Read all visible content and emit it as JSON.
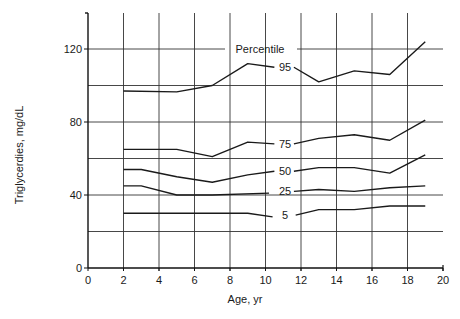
{
  "chart_data": {
    "type": "line",
    "title": "",
    "xlabel": "Age, yr",
    "ylabel": "Triglycerdies, mg/dL",
    "xlim": [
      0,
      20
    ],
    "ylim": [
      0,
      140
    ],
    "xticks": [
      0,
      2,
      4,
      6,
      8,
      10,
      12,
      14,
      16,
      18,
      20
    ],
    "yticks": [
      0,
      40,
      80,
      120
    ],
    "grid": {
      "horizontal_every": 20,
      "vertical_every": 2
    },
    "legend_title": "Percentile",
    "series": [
      {
        "name": "95",
        "x": [
          2,
          5,
          7,
          9,
          10.5,
          13,
          15,
          17,
          19
        ],
        "y": [
          97,
          96.5,
          100,
          112,
          110,
          102,
          108,
          106,
          124
        ]
      },
      {
        "name": "75",
        "x": [
          2,
          5,
          7,
          9,
          10.5,
          13,
          15,
          17,
          19
        ],
        "y": [
          65,
          65,
          61,
          69,
          68,
          71,
          73,
          70,
          81
        ]
      },
      {
        "name": "50",
        "x": [
          2,
          3,
          5,
          7,
          9,
          10.5,
          13,
          15,
          17,
          19
        ],
        "y": [
          54,
          54,
          50,
          47,
          51,
          53,
          55,
          55,
          52,
          62
        ]
      },
      {
        "name": "25",
        "x": [
          2,
          3,
          5,
          7,
          10.2,
          13,
          15,
          17,
          19
        ],
        "y": [
          45,
          45,
          40,
          40,
          41,
          43,
          42,
          44,
          45
        ]
      },
      {
        "name": "5",
        "x": [
          2,
          5,
          9,
          10.4,
          13,
          15,
          17,
          19
        ],
        "y": [
          30,
          30,
          30,
          28,
          32,
          32,
          34,
          34
        ]
      }
    ],
    "curve_labels": [
      {
        "text": "95",
        "x": 11.1,
        "y": 110
      },
      {
        "text": "75",
        "x": 11.1,
        "y": 68
      },
      {
        "text": "50",
        "x": 11.1,
        "y": 53
      },
      {
        "text": "25",
        "x": 11.1,
        "y": 42
      },
      {
        "text": "5",
        "x": 11.1,
        "y": 29
      }
    ]
  }
}
